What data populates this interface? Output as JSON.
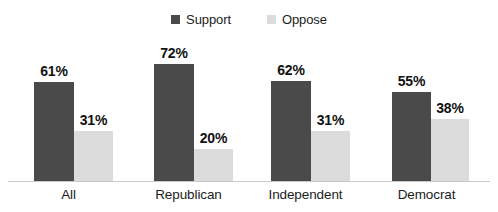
{
  "chart_data": {
    "type": "bar",
    "title": "",
    "xlabel": "",
    "ylabel": "",
    "ylim": [
      0,
      100
    ],
    "grid": false,
    "legend_position": "top-center",
    "categories": [
      "All",
      "Republican",
      "Independent",
      "Democrat"
    ],
    "series": [
      {
        "name": "Support",
        "color": "#4a4a4a",
        "values": [
          61,
          72,
          62,
          55
        ],
        "labels": [
          "61%",
          "72%",
          "62%",
          "55%"
        ]
      },
      {
        "name": "Oppose",
        "color": "#dcdcdc",
        "values": [
          31,
          20,
          31,
          38
        ],
        "labels": [
          "31%",
          "20%",
          "31%",
          "38%"
        ]
      }
    ]
  },
  "legend": {
    "entries": [
      {
        "label": "Support",
        "color": "#4a4a4a"
      },
      {
        "label": "Oppose",
        "color": "#dcdcdc"
      }
    ]
  },
  "axis": {
    "baseline_color": "#c9c9c9"
  }
}
